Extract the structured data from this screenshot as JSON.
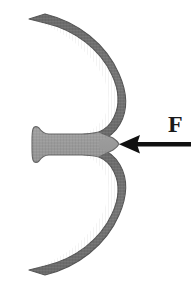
{
  "figure": {
    "background_color": "#ffffff",
    "canvas": {
      "width": 191,
      "height": 289
    },
    "annotations": {
      "force_label": "F"
    },
    "colors": {
      "arm_fill": "#6e6e6e",
      "arm_fill_light": "#8f8f8f",
      "web_fill": "#9a9a9a",
      "outline": "#5a5a5a",
      "arrow": "#111111",
      "label": "#1a1a1a"
    },
    "parts": [
      {
        "name": "upper-arm",
        "description": "Upper curved arm sweeping from top-left down to the central waist",
        "fill": "#6e6e6e"
      },
      {
        "name": "lower-arm",
        "description": "Lower curved arm mirroring the upper arm, from central waist down to bottom-left",
        "fill": "#6e6e6e"
      },
      {
        "name": "center-web",
        "description": "Lighter horizontal web joining the left tab to the central waist",
        "fill": "#9a9a9a"
      },
      {
        "name": "left-tab",
        "description": "Small rounded tab with concave S-curve at the left end of the web",
        "fill": "#9a9a9a"
      },
      {
        "name": "center-notch",
        "description": "V-shaped notch on the right side of the central waist where the force is applied"
      }
    ],
    "force_arrow": {
      "name": "force-arrow",
      "label": "F",
      "direction": "left",
      "tail_x": 191,
      "tip_x": 119,
      "y": 144,
      "shaft_thickness": 4,
      "head_length": 18,
      "head_width": 18,
      "color": "#111111"
    }
  }
}
